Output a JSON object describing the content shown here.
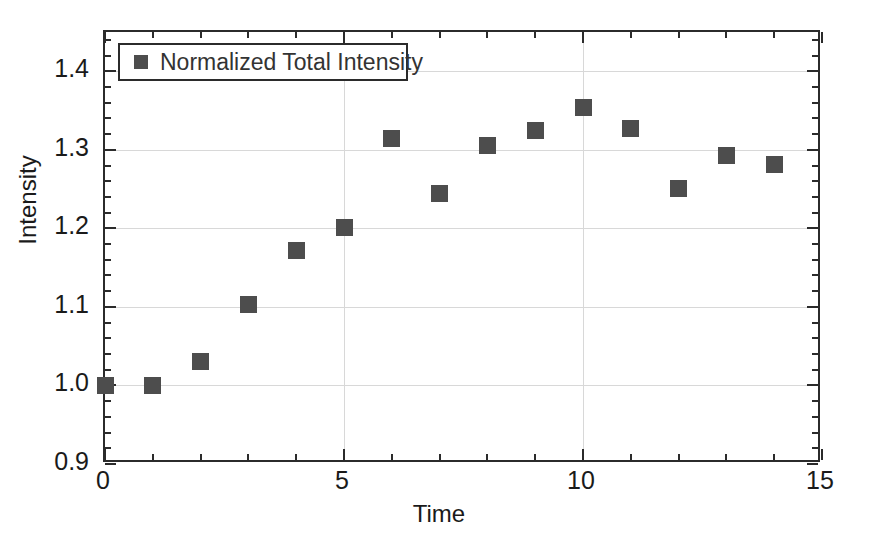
{
  "chart_data": {
    "type": "scatter",
    "title": "",
    "xlabel": "Time",
    "ylabel": "Intensity",
    "xlim": [
      0,
      15
    ],
    "ylim": [
      0.9,
      1.45
    ],
    "grid": true,
    "legend_position": "top-left",
    "x_ticks": [
      0,
      5,
      10,
      15
    ],
    "x_tick_labels": [
      "0",
      "5",
      "10",
      "15"
    ],
    "x_minor_tick_interval": 1,
    "y_ticks": [
      0.9,
      1.0,
      1.1,
      1.2,
      1.3,
      1.4
    ],
    "y_tick_labels": [
      "0.9",
      "1.0",
      "1.1",
      "1.2",
      "1.3",
      "1.4"
    ],
    "y_minor_tick_interval": 0.02,
    "marker": "square",
    "marker_color": "#4d4d4d",
    "series": [
      {
        "name": "Normalized Total Intensity",
        "x": [
          0,
          1,
          2,
          3,
          4,
          5,
          6,
          7,
          8,
          9,
          10,
          11,
          12,
          13,
          14
        ],
        "values": [
          1.0,
          1.0,
          1.031,
          1.103,
          1.172,
          1.201,
          1.315,
          1.245,
          1.306,
          1.325,
          1.354,
          1.327,
          1.251,
          1.293,
          1.281
        ]
      }
    ]
  },
  "legend": {
    "entries": [
      {
        "label": "Normalized Total Intensity",
        "color": "#4d4d4d"
      }
    ]
  },
  "axes": {
    "x_title": "Time",
    "y_title": "Intensity"
  },
  "colors": {
    "marker": "#4d4d4d",
    "axis": "#2b2b2b",
    "grid": "#d8d8d8",
    "background": "#ffffff",
    "text": "#1a1a1a"
  }
}
